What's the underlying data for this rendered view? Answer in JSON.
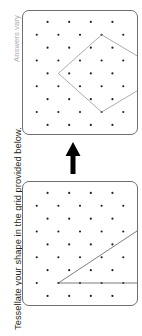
{
  "page": {
    "width": 142,
    "height": 336,
    "background": "#ffffff",
    "orientation": "rotated-90"
  },
  "instruction": {
    "text": "Tessellate your shape in the grid provided below.",
    "color": "#231f20"
  },
  "answer_note": {
    "text": "Answers vary",
    "color": "#a7a9ac"
  },
  "arrow": {
    "name": "up-arrow",
    "direction": "up",
    "color": "#000000"
  },
  "panels": {
    "source": {
      "label": "source-grid",
      "border_color": "#6d6e71",
      "dot_color": "#231f20",
      "shape": {
        "name": "right-triangle",
        "stroke": "#58595b",
        "vertices": [
          [
            1,
            7
          ],
          [
            5,
            7
          ],
          [
            5,
            2
          ]
        ]
      }
    },
    "target": {
      "label": "target-grid",
      "border_color": "#6d6e71",
      "dot_color": "#231f20",
      "shape": {
        "name": "rotated-square-diamond",
        "stroke": "#939598",
        "vertices": [
          [
            3,
            1
          ],
          [
            5.5,
            4
          ],
          [
            3,
            7
          ],
          [
            0.5,
            4
          ]
        ]
      }
    }
  },
  "grid": {
    "type": "staggered-isometric-dots",
    "rows": 9,
    "dots_per_even_row": 4,
    "dots_per_odd_row": 5,
    "dot_radius": 1.1,
    "dot_color": "#231f20"
  }
}
